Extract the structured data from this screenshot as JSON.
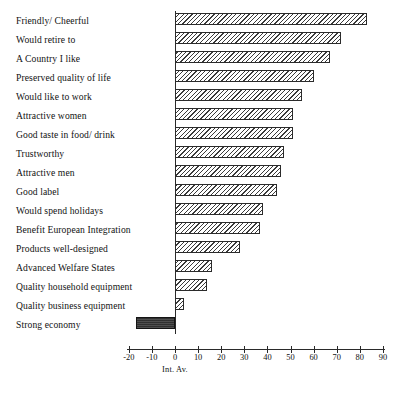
{
  "chart_data": {
    "type": "bar",
    "orientation": "horizontal",
    "title": "",
    "subtitle": "",
    "xlabel": "Int. Av.",
    "ylabel": "",
    "xlim": [
      -20,
      90
    ],
    "xticks": [
      -20,
      -10,
      0,
      10,
      20,
      30,
      40,
      50,
      60,
      70,
      80,
      90
    ],
    "xtick_labels": [
      "-20",
      "-10",
      "0",
      "10",
      "20",
      "30",
      "40",
      "50",
      "60",
      "70",
      "80",
      "90"
    ],
    "grid": false,
    "legend": null,
    "zero_reference_line": true,
    "categories": [
      "Friendly/ Cheerful",
      "Would retire to",
      "A Country I like",
      "Preserved quality of life",
      "Would like to work",
      "Attractive women",
      "Good taste in food/ drink",
      "Trustworthy",
      "Attractive men",
      "Good label",
      "Would spend holidays",
      "Benefit European Integration",
      "Products well-designed",
      "Advanced Welfare States",
      "Quality household equipment",
      "Quality business equipment",
      "Strong economy"
    ],
    "values": [
      83,
      72,
      67,
      60,
      55,
      51,
      51,
      47,
      46,
      44,
      38,
      37,
      28,
      16,
      14,
      4,
      -17
    ],
    "bars": [
      {
        "label": "Friendly/ Cheerful",
        "value": 83,
        "style": "hatched"
      },
      {
        "label": "Would retire to",
        "value": 72,
        "style": "hatched"
      },
      {
        "label": "A Country I like",
        "value": 67,
        "style": "hatched"
      },
      {
        "label": "Preserved quality of life",
        "value": 60,
        "style": "hatched"
      },
      {
        "label": "Would like to work",
        "value": 55,
        "style": "hatched"
      },
      {
        "label": "Attractive women",
        "value": 51,
        "style": "hatched"
      },
      {
        "label": "Good taste in food/ drink",
        "value": 51,
        "style": "hatched"
      },
      {
        "label": "Trustworthy",
        "value": 47,
        "style": "hatched"
      },
      {
        "label": "Attractive men",
        "value": 46,
        "style": "hatched"
      },
      {
        "label": "Good label",
        "value": 44,
        "style": "hatched"
      },
      {
        "label": "Would spend holidays",
        "value": 38,
        "style": "hatched"
      },
      {
        "label": "Benefit European Integration",
        "value": 37,
        "style": "hatched"
      },
      {
        "label": "Products well-designed",
        "value": 28,
        "style": "hatched"
      },
      {
        "label": "Advanced Welfare States",
        "value": 16,
        "style": "hatched"
      },
      {
        "label": "Quality household equipment",
        "value": 14,
        "style": "hatched"
      },
      {
        "label": "Quality business equipment",
        "value": 4,
        "style": "hatched"
      },
      {
        "label": "Strong economy",
        "value": -17,
        "style": "solid-dark"
      }
    ],
    "colors": {
      "bar_outline": "#2b2b2b",
      "bar_fill": "#ffffff",
      "bar_hatch": "#3a3a3a",
      "negative_bar_fill": "#3b3b3b",
      "axis": "#2a2a2a",
      "text": "#121212",
      "background": "#ffffff"
    }
  }
}
